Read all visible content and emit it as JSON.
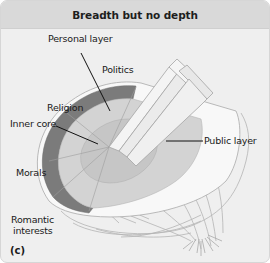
{
  "title": "Breadth but no depth",
  "panel_tag": "(c)",
  "labels": {
    "personal_layer": "Personal layer",
    "politics": "Politics",
    "religion": "Religion",
    "inner_core": "Inner core",
    "public_layer": "Public layer",
    "morals": "Morals",
    "romantic_line1": "Romantic",
    "romantic_line2": "interests"
  },
  "colors": {
    "background": "#efefef",
    "title_bar": "#d9d9d9",
    "personal_ring": "#7a7a7a",
    "inner_disc": "#d4d4d4",
    "core": "#c4c4c4",
    "public_layer": "#f7f7f7",
    "outline": "#a8a8a8"
  }
}
